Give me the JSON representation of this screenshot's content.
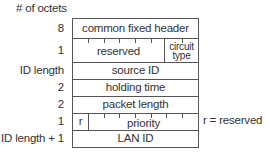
{
  "diagram": {
    "title": "# of octets",
    "rows": [
      {
        "octets": "8",
        "fields": [
          {
            "label": "common fixed header"
          }
        ]
      },
      {
        "octets": "1",
        "fields": [
          {
            "label": "reserved"
          },
          {
            "label_line1": "circuit",
            "label_line2": "type"
          }
        ]
      },
      {
        "octets": "ID length",
        "fields": [
          {
            "label": "source ID"
          }
        ]
      },
      {
        "octets": "2",
        "fields": [
          {
            "label": "holding time"
          }
        ]
      },
      {
        "octets": "2",
        "fields": [
          {
            "label": "packet length"
          }
        ]
      },
      {
        "octets": "1",
        "fields": [
          {
            "label": "r"
          },
          {
            "label": "priority"
          }
        ]
      },
      {
        "octets": "ID length + 1",
        "fields": [
          {
            "label": "LAN ID"
          }
        ]
      }
    ],
    "legend": "r = reserved",
    "colors": {
      "line": "#555555",
      "text": "#333333",
      "background": "#ffffff"
    }
  }
}
